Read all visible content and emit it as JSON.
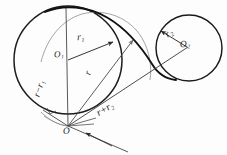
{
  "diagram": {
    "background_color": "#fdfdfd",
    "ink_color": "#2a2a2a",
    "bold_ink_color": "#151515",
    "light_ink_color": "#8d8d8d",
    "labels": {
      "center_1": "O₁",
      "center_2": "O₂",
      "point_o": "O",
      "radius_1": "r₁",
      "radius_2": "r₂",
      "radius_r": "r",
      "distance_minus": "r−r₁",
      "distance_plus": "r+r₂"
    },
    "shapes": {
      "circle_1": {
        "cx": 68,
        "cy": 60,
        "r": 54,
        "style": "bold"
      },
      "circle_2": {
        "cx": 189,
        "cy": 48,
        "r": 33,
        "style": "bold"
      },
      "arc_r": {
        "cx": 68,
        "cy": 126,
        "r": 67,
        "style": "light"
      },
      "point_o": {
        "x": 68,
        "y": 126
      }
    },
    "segments": [
      {
        "name": "o-to-top",
        "label": "r−r₁"
      },
      {
        "name": "o1-to-edge",
        "label": "r₁"
      },
      {
        "name": "o-to-arc",
        "label": "r"
      },
      {
        "name": "o-to-o2",
        "label": "r+r₂"
      },
      {
        "name": "o2-to-edge",
        "label": "r₂"
      }
    ]
  }
}
